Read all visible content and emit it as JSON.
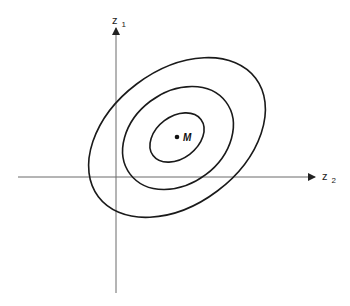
{
  "diagram": {
    "type": "contour-ellipses",
    "axes": {
      "vertical": {
        "label_main": "z",
        "label_sub": "1"
      },
      "horizontal": {
        "label_main": "z",
        "label_sub": "2"
      }
    },
    "center": {
      "label": "M"
    },
    "contours": [
      {
        "name": "inner",
        "level": 1
      },
      {
        "name": "middle",
        "level": 2
      },
      {
        "name": "outer",
        "level": 3
      }
    ],
    "colors": {
      "axis": "#6a6a6a",
      "contour": "#1a1a1a",
      "background": "#ffffff"
    }
  }
}
